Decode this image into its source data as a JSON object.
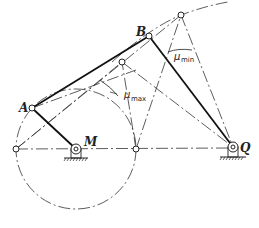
{
  "diagram": {
    "type": "four-bar linkage (crank-rocker) transmission angle diagram",
    "labels": {
      "A": "A",
      "B": "B",
      "M": "M",
      "Q": "Q",
      "mu_max": "μ",
      "mu_max_sub": "max",
      "mu_min": "μ",
      "mu_min_sub": "min"
    },
    "points": {
      "M": [
        76,
        149
      ],
      "Q": [
        233,
        147
      ],
      "A": [
        32,
        108
      ],
      "B": [
        149,
        36
      ],
      "B_top": [
        181,
        15
      ],
      "B_mid": [
        122,
        62
      ],
      "A_left": [
        16,
        149
      ],
      "A_right": [
        136,
        149
      ]
    },
    "crank_circle": {
      "center": [
        76,
        149
      ],
      "radius": 60
    },
    "colors": {
      "line": "#222222",
      "background": "#ffffff"
    }
  }
}
